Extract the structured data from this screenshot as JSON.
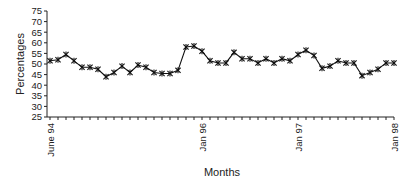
{
  "chart_data": {
    "type": "line",
    "title": "",
    "xlabel": "Months",
    "ylabel": "Percentages",
    "ylim": [
      25,
      75
    ],
    "yticks": [
      25,
      30,
      35,
      40,
      45,
      50,
      55,
      60,
      65,
      70,
      75
    ],
    "grid": false,
    "legend": null,
    "marker": "asterisk",
    "x_tick_labels": [
      {
        "index": 0,
        "label": "June 94"
      },
      {
        "index": 19,
        "label": "Jan 96"
      },
      {
        "index": 31,
        "label": "Jan 97"
      },
      {
        "index": 43,
        "label": "Jan 98"
      }
    ],
    "x_start": "June 94",
    "x_end": "Jan 98",
    "series": [
      {
        "name": "Percentages",
        "values": [
          51.5,
          52,
          54.5,
          51.5,
          48.5,
          48.5,
          47.5,
          44,
          46,
          49,
          46,
          49.5,
          48.5,
          46,
          45.5,
          45.5,
          47,
          58,
          58.5,
          56,
          51.5,
          50.5,
          50.5,
          55.5,
          52.5,
          52.5,
          50.5,
          52.5,
          50.5,
          52.5,
          51.5,
          54.5,
          56.5,
          54,
          48,
          49,
          51.5,
          50.5,
          50.5,
          44.5,
          46,
          47.5,
          50.5,
          50.5
        ]
      }
    ]
  }
}
